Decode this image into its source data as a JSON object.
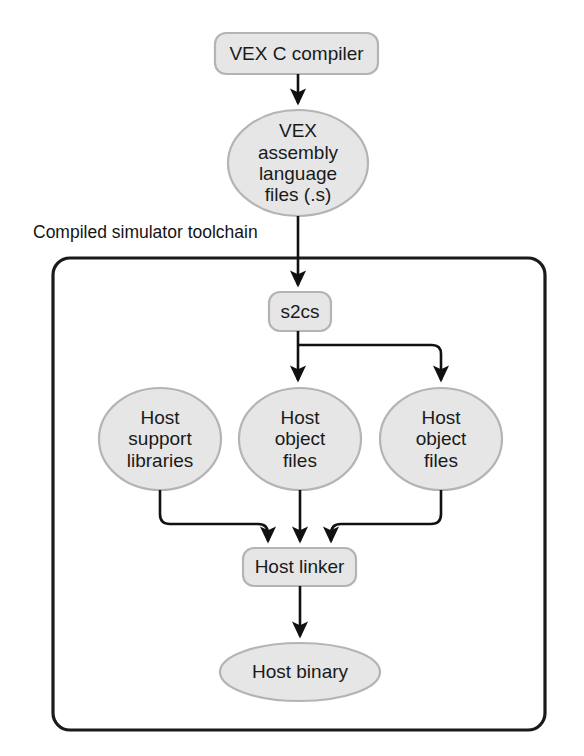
{
  "diagram": {
    "title": "Compiled simulator toolchain",
    "colors": {
      "node_fill": "#e6e6e6",
      "node_stroke": "#b4b4b4",
      "edge_stroke": "#111111",
      "group_stroke": "#1a1a1a",
      "text": "#1a1a1a",
      "background": "#ffffff"
    },
    "group": {
      "caption": "Compiled simulator toolchain"
    },
    "nodes": {
      "vex_c_compiler": {
        "label": "VEX C compiler",
        "shape": "rounded-box"
      },
      "vex_assembly_files": {
        "label": "VEX\nassembly\nlanguage\nfiles (.s)",
        "shape": "ellipse"
      },
      "s2cs": {
        "label": "s2cs",
        "shape": "rounded-box"
      },
      "host_support_libraries": {
        "label": "Host\nsupport\nlibraries",
        "shape": "ellipse"
      },
      "host_object_files_center": {
        "label": "Host\nobject\nfiles",
        "shape": "ellipse"
      },
      "host_object_files_right": {
        "label": "Host\nobject\nfiles",
        "shape": "ellipse"
      },
      "host_linker": {
        "label": "Host linker",
        "shape": "rounded-box"
      },
      "host_binary": {
        "label": "Host binary",
        "shape": "ellipse"
      }
    },
    "edges": [
      {
        "from": "vex_c_compiler",
        "to": "vex_assembly_files"
      },
      {
        "from": "vex_assembly_files",
        "to": "s2cs"
      },
      {
        "from": "s2cs",
        "to": "host_object_files_center"
      },
      {
        "from": "s2cs",
        "to": "host_object_files_right"
      },
      {
        "from": "host_support_libraries",
        "to": "host_linker"
      },
      {
        "from": "host_object_files_center",
        "to": "host_linker"
      },
      {
        "from": "host_object_files_right",
        "to": "host_linker"
      },
      {
        "from": "host_linker",
        "to": "host_binary"
      }
    ]
  }
}
